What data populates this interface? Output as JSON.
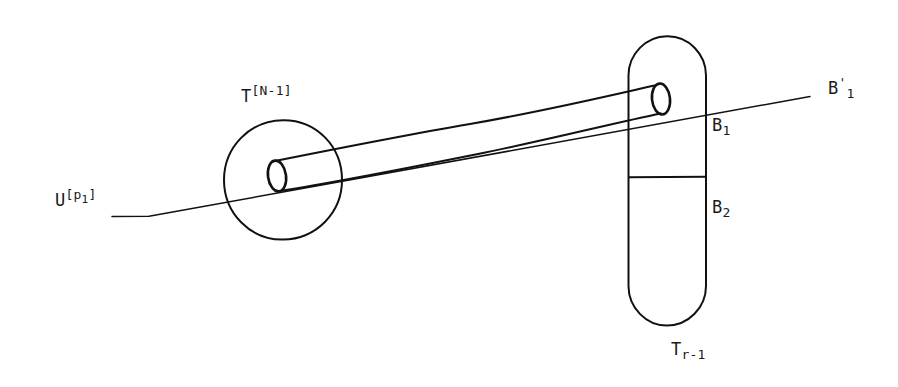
{
  "figure": {
    "kind": "hand-drawn-mathematical-diagram",
    "background_color": "#ffffff",
    "ink_color": "#111111",
    "width": 898,
    "height": 387
  },
  "labels": {
    "tube_body_label": {
      "base": "T",
      "superscript": "[N-1]",
      "full": "T[N-1]"
    },
    "incoming_line_label": {
      "base": "U",
      "superscript": "[p1]",
      "superscript_base": "[p",
      "superscript_sub": "1",
      "superscript_close": "]",
      "full": "U[p1]"
    },
    "upper_region_label": {
      "base": "B",
      "subscript": "1",
      "full": "B1"
    },
    "lower_region_label": {
      "base": "B",
      "subscript": "2",
      "full": "B2"
    },
    "outgoing_line_label": {
      "base": "B",
      "prime": "'",
      "subscript": "1",
      "full": "B'1"
    },
    "capsule_label": {
      "base": "T",
      "subscript": "r-1",
      "full": "Tr-1"
    }
  },
  "shapes": {
    "circle": {
      "name": "circle-outline",
      "cx": 283,
      "cy": 180,
      "r": 59
    },
    "circle_tube_mouth": {
      "name": "tube-mouth-ellipse-left",
      "cx": 277,
      "cy": 176,
      "rx": 9,
      "ry": 15,
      "rotation": -8
    },
    "capsule": {
      "name": "capsule-outline",
      "x": 628,
      "y": 36,
      "width": 78,
      "height": 289,
      "radius": 39
    },
    "capsule_divider": {
      "name": "capsule-divider-line",
      "x1": 629,
      "y1": 177,
      "x2": 706,
      "y2": 177
    },
    "capsule_tube_mouth": {
      "name": "tube-mouth-ellipse-right",
      "cx": 661,
      "cy": 99,
      "rx": 9,
      "ry": 15,
      "rotation": -6
    },
    "tube_upper_edge": {
      "name": "tube-upper-edge",
      "path": "M 271 161 C 360 139, 520 112, 655 85"
    },
    "tube_lower_edge": {
      "name": "tube-lower-edge",
      "path": "M 280 191 C 372 170, 528 132, 660 113"
    },
    "axis_line": {
      "name": "axis-line",
      "points": "112,216 148,216 810,96"
    }
  }
}
